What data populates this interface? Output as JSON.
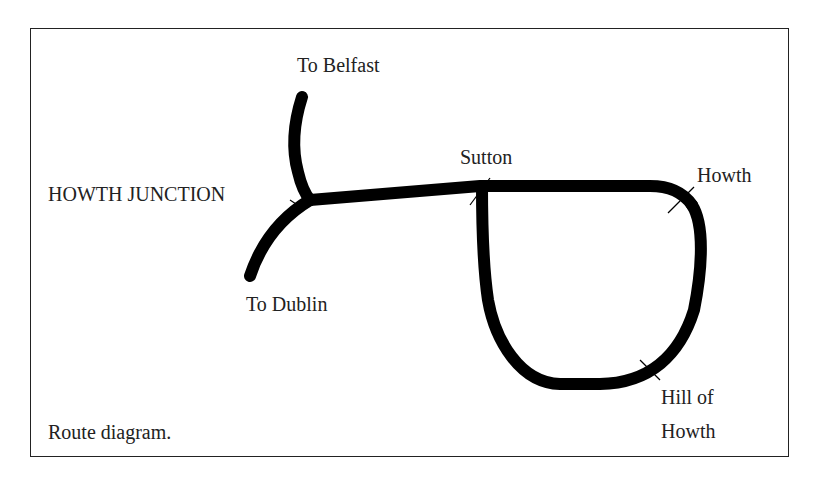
{
  "diagram": {
    "caption": "Route diagram.",
    "labels": {
      "to_belfast": "To Belfast",
      "howth_junction": "HOWTH JUNCTION",
      "to_dublin": "To Dublin",
      "sutton": "Sutton",
      "howth": "Howth",
      "hill_of_howth_line1": "Hill of",
      "hill_of_howth_line2": "Howth"
    },
    "colors": {
      "line": "#000000",
      "text": "#222222",
      "frame": "#222222"
    }
  }
}
